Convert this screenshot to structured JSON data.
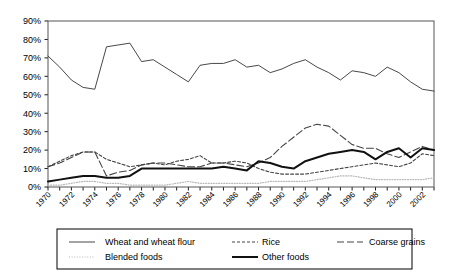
{
  "chart_data": {
    "type": "line",
    "title": "",
    "xlabel": "",
    "ylabel": "",
    "ylim": [
      0,
      90
    ],
    "xlim": [
      1970,
      2003
    ],
    "grid": false,
    "legend_position": "bottom",
    "y_ticks": [
      "0%",
      "10%",
      "20%",
      "30%",
      "40%",
      "50%",
      "60%",
      "70%",
      "80%",
      "90%"
    ],
    "y_tick_values": [
      0,
      10,
      20,
      30,
      40,
      50,
      60,
      70,
      80,
      90
    ],
    "x_tick_labels": [
      "1970",
      "1972",
      "1974",
      "1976",
      "1978",
      "1980",
      "1982",
      "1984",
      "1986",
      "1988",
      "1990",
      "1992",
      "1994",
      "1996",
      "1998",
      "2000",
      "2002"
    ],
    "x": [
      1970,
      1971,
      1972,
      1973,
      1974,
      1975,
      1976,
      1977,
      1978,
      1979,
      1980,
      1981,
      1982,
      1983,
      1984,
      1985,
      1986,
      1987,
      1988,
      1989,
      1990,
      1991,
      1992,
      1993,
      1994,
      1995,
      1996,
      1997,
      1998,
      1999,
      2000,
      2001,
      2002,
      2003
    ],
    "series": [
      {
        "name": "Wheat and wheat flour",
        "style": "solid-thin",
        "color": "#333333",
        "values": [
          71,
          65,
          58,
          54,
          53,
          76,
          77,
          78,
          68,
          69,
          65,
          61,
          57,
          66,
          67,
          67,
          69,
          65,
          66,
          62,
          64,
          67,
          69,
          65,
          62,
          58,
          63,
          62,
          60,
          65,
          62,
          57,
          53,
          52
        ]
      },
      {
        "name": "Rice",
        "style": "dashed-short",
        "color": "#444444",
        "values": [
          11,
          14,
          17,
          19,
          19,
          15,
          13,
          11,
          12,
          13,
          12,
          14,
          15,
          17,
          13,
          13,
          14,
          13,
          10,
          8,
          7,
          7,
          7,
          8,
          9,
          10,
          11,
          12,
          13,
          12,
          11,
          13,
          18,
          17
        ]
      },
      {
        "name": "Coarse grains",
        "style": "dashed-long",
        "color": "#444444",
        "values": [
          11,
          13,
          16,
          19,
          19,
          6,
          8,
          9,
          12,
          13,
          13,
          12,
          11,
          11,
          13,
          13,
          12,
          11,
          13,
          16,
          22,
          27,
          32,
          34,
          33,
          28,
          23,
          21,
          21,
          18,
          16,
          19,
          22,
          20
        ]
      },
      {
        "name": "Blended foods",
        "style": "dotted",
        "color": "#b8b8b8",
        "values": [
          1,
          1,
          2,
          3,
          3,
          2,
          2,
          1,
          1,
          1,
          1,
          2,
          3,
          2,
          2,
          2,
          2,
          2,
          2,
          3,
          3,
          3,
          3,
          4,
          5,
          6,
          6,
          5,
          4,
          4,
          4,
          4,
          4,
          5
        ]
      },
      {
        "name": "Other foods",
        "style": "solid-bold",
        "color": "#111111",
        "values": [
          3,
          4,
          5,
          6,
          6,
          5,
          5,
          6,
          10,
          10,
          10,
          10,
          10,
          10,
          10,
          11,
          10,
          9,
          14,
          13,
          11,
          10,
          14,
          16,
          18,
          19,
          20,
          19,
          15,
          19,
          21,
          16,
          21,
          20
        ]
      }
    ]
  },
  "legend": {
    "items": [
      {
        "label": "Wheat and wheat flour",
        "swatch": "solid-thin"
      },
      {
        "label": "Rice",
        "swatch": "dashed-short"
      },
      {
        "label": "Coarse grains",
        "swatch": "dashed-long"
      },
      {
        "label": "Blended foods",
        "swatch": "dotted"
      },
      {
        "label": "Other foods",
        "swatch": "solid-bold"
      }
    ]
  }
}
